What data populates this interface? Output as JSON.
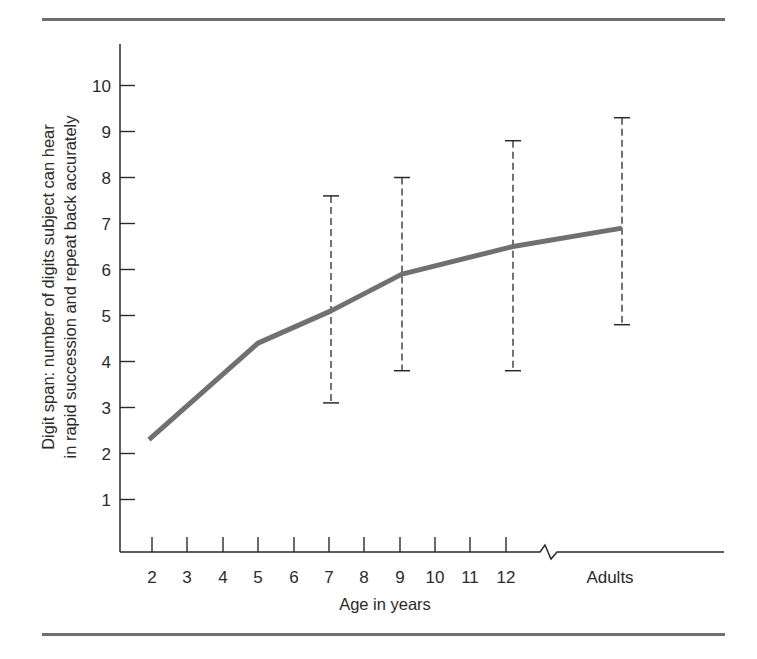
{
  "chart_data": {
    "type": "line",
    "title": "",
    "xlabel": "Age in years",
    "ylabel": [
      "Digit span:  number of digits subject can hear",
      "in rapid succession and repeat back accurately"
    ],
    "x_tick_labels": [
      "2",
      "3",
      "4",
      "5",
      "6",
      "7",
      "8",
      "9",
      "10",
      "11",
      "12",
      "Adults"
    ],
    "y_tick_labels": [
      "1",
      "2",
      "3",
      "4",
      "5",
      "6",
      "7",
      "8",
      "9",
      "10"
    ],
    "ylim": [
      0,
      11
    ],
    "grid": false,
    "legend": null,
    "axis_break": "between 12 and Adults",
    "series": [
      {
        "name": "Mean digit span",
        "x": [
          "2",
          "5",
          "7",
          "9",
          "12",
          "Adults"
        ],
        "values": [
          2.3,
          4.4,
          5.1,
          5.9,
          6.5,
          6.9
        ],
        "color": "#707070"
      }
    ],
    "error_bars": [
      {
        "x": "7",
        "low": 3.1,
        "high": 7.6
      },
      {
        "x": "9",
        "low": 3.8,
        "high": 8.0
      },
      {
        "x": "12",
        "low": 3.8,
        "high": 8.8
      },
      {
        "x": "Adults",
        "low": 4.8,
        "high": 9.3
      }
    ]
  }
}
